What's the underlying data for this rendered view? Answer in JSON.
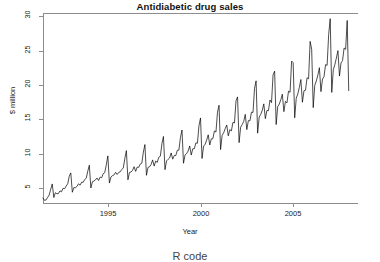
{
  "chart_data": {
    "type": "line",
    "title": "Antidiabetic drug sales",
    "xlabel": "Year",
    "ylabel": "$ million",
    "grid": false,
    "legend": null,
    "xlim": [
      1991.5,
      2008.5
    ],
    "ylim": [
      2.8,
      30.5
    ],
    "xticks": [
      1995,
      2000,
      2005
    ],
    "xtick_labels": [
      "1995",
      "2000",
      "2005"
    ],
    "yticks": [
      5,
      10,
      15,
      20,
      25,
      30
    ],
    "ytick_labels": [
      "5",
      "10",
      "15",
      "20",
      "25",
      "30"
    ],
    "x_start": 1991.5,
    "x_step": 0.0833333,
    "frequency": "monthly",
    "series_name": "Antidiabetic drug sales",
    "line_color": "#000000",
    "values": [
      3.53,
      3.18,
      3.25,
      3.61,
      3.97,
      4.81,
      5.58,
      3.6,
      4.3,
      4.15,
      4.19,
      4.57,
      4.44,
      4.95,
      4.88,
      5.27,
      5.6,
      6.71,
      7.19,
      4.37,
      5.05,
      5.02,
      5.22,
      5.6,
      5.39,
      5.83,
      5.81,
      6.22,
      6.41,
      7.43,
      8.31,
      4.99,
      5.9,
      6.0,
      6.18,
      6.44,
      6.08,
      6.58,
      6.49,
      7.07,
      7.24,
      8.37,
      9.67,
      5.71,
      6.6,
      6.79,
      6.9,
      7.27,
      6.96,
      7.25,
      7.35,
      7.68,
      7.91,
      9.29,
      10.44,
      6.19,
      7.25,
      7.32,
      7.56,
      8.09,
      7.41,
      8.03,
      8.0,
      8.49,
      8.61,
      10.22,
      11.32,
      6.84,
      7.99,
      8.08,
      8.42,
      9.08,
      8.18,
      8.92,
      8.72,
      9.48,
      9.63,
      11.42,
      12.5,
      7.66,
      8.93,
      9.17,
      9.37,
      10.1,
      9.19,
      9.72,
      9.72,
      10.49,
      10.51,
      12.33,
      13.44,
      8.6,
      9.81,
      10.02,
      10.38,
      11.12,
      9.79,
      10.7,
      10.71,
      11.56,
      11.51,
      14.06,
      15.2,
      9.29,
      11.08,
      11.36,
      11.97,
      12.74,
      11.25,
      12.15,
      12.17,
      13.31,
      13.14,
      16.03,
      17.05,
      10.59,
      12.64,
      13.05,
      13.65,
      14.17,
      12.59,
      13.5,
      13.31,
      14.55,
      14.48,
      17.7,
      18.27,
      11.6,
      13.86,
      14.24,
      14.7,
      15.72,
      13.5,
      14.81,
      14.78,
      16.04,
      16.0,
      19.53,
      20.61,
      12.98,
      15.32,
      15.72,
      16.31,
      17.25,
      15.09,
      16.29,
      16.27,
      17.82,
      17.43,
      21.49,
      22.02,
      14.24,
      16.86,
      17.22,
      17.85,
      18.66,
      16.12,
      17.61,
      17.4,
      19.11,
      18.93,
      23.49,
      23.26,
      15.22,
      18.08,
      18.69,
      19.65,
      20.8,
      17.48,
      19.16,
      19.24,
      21.06,
      20.91,
      26.36,
      25.21,
      16.7,
      19.96,
      20.59,
      21.43,
      22.53,
      19.04,
      20.88,
      21.22,
      22.97,
      22.88,
      27.35,
      29.67,
      18.92,
      22.22,
      22.97,
      23.94,
      25.02,
      21.3,
      23.22,
      23.56,
      25.4,
      25.2,
      29.41,
      19.18
    ],
    "annotations": []
  },
  "footer": {
    "note": "R code"
  }
}
